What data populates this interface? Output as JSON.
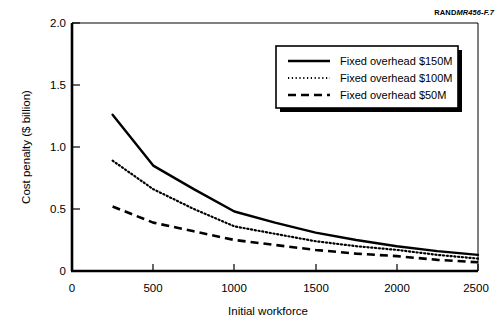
{
  "figure": {
    "source_credit_bold": "RAND",
    "source_credit_italic": "MR456-F.7"
  },
  "chart_data": {
    "type": "line",
    "title": "",
    "subtitle": "",
    "xlabel": "Initial workforce",
    "ylabel": "Cost penalty ($ billion)",
    "xlim": [
      0,
      2500
    ],
    "ylim": [
      0,
      2.0
    ],
    "xticks": [
      0,
      500,
      1000,
      1500,
      2000,
      2500
    ],
    "xtick_labels": [
      "0",
      "500",
      "1000",
      "1500",
      "2000",
      "2500"
    ],
    "yticks": [
      0,
      0.5,
      1.0,
      1.5,
      2.0
    ],
    "ytick_labels": [
      "0",
      "0.5",
      "1.0",
      "1.5",
      "2.0"
    ],
    "grid": false,
    "legend_position": "top-right",
    "x": [
      250,
      500,
      750,
      1000,
      1250,
      1500,
      1750,
      2000,
      2250,
      2500
    ],
    "series": [
      {
        "name": "Fixed overhead $150M",
        "style": "solid",
        "color": "#000000",
        "values": [
          1.26,
          0.85,
          0.66,
          0.48,
          0.39,
          0.31,
          0.25,
          0.2,
          0.16,
          0.13
        ]
      },
      {
        "name": "Fixed overhead $100M",
        "style": "dotted",
        "color": "#000000",
        "values": [
          0.89,
          0.66,
          0.5,
          0.36,
          0.3,
          0.24,
          0.2,
          0.17,
          0.13,
          0.1
        ]
      },
      {
        "name": "Fixed overhead $50M",
        "style": "dashed",
        "color": "#000000",
        "values": [
          0.52,
          0.39,
          0.32,
          0.25,
          0.21,
          0.17,
          0.14,
          0.12,
          0.09,
          0.07
        ]
      }
    ]
  },
  "legend": {
    "items": [
      {
        "label": "Fixed overhead $150M",
        "style": "solid"
      },
      {
        "label": "Fixed overhead $100M",
        "style": "dotted"
      },
      {
        "label": "Fixed overhead $50M",
        "style": "dashed"
      }
    ]
  }
}
